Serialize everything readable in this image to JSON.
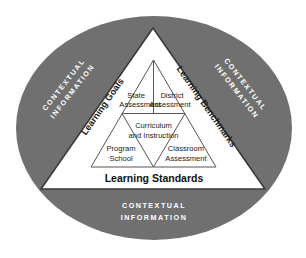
{
  "diagram": {
    "colors": {
      "ellipse_fill": "#707070",
      "triangle_fill": "#ffffff",
      "outline": "#3a3a3a",
      "inner_line": "#55555a",
      "context_text": "#ffffff",
      "label_text": "#1a1a1a",
      "page_background": "#ffffff"
    },
    "context_ring": {
      "left": {
        "line1": "CONTEXTUAL",
        "line2": "INFORMATION"
      },
      "right": {
        "line1": "CONTEXTUAL",
        "line2": "INFORMATION"
      },
      "bottom": {
        "line1": "CONTEXTUAL",
        "line2": "INFORMATION"
      }
    },
    "triangle_edges": {
      "left_label": "Learning Goals",
      "right_label": "Learning Benchmarks",
      "base_label": "Learning Standards"
    },
    "inner_cells": [
      {
        "id": "state-assessment",
        "line1": "State",
        "line2": "Assessment",
        "position": "top-left"
      },
      {
        "id": "district-assessment",
        "line1": "District",
        "line2": "Assessment",
        "position": "top-right"
      },
      {
        "id": "curriculum-and-instruction",
        "line1": "Curriculum",
        "line2": "and Instruction",
        "position": "middle-center"
      },
      {
        "id": "program-school",
        "line1": "Program",
        "line2": "School",
        "position": "bottom-left"
      },
      {
        "id": "classroom-assessment",
        "line1": "Classroom",
        "line2": "Assessment",
        "position": "bottom-right"
      }
    ]
  }
}
